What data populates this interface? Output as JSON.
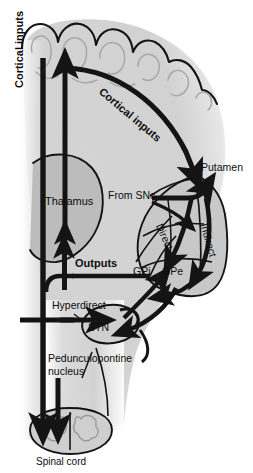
{
  "figure": {
    "kind": "neuroanatomy-circuit-diagram",
    "palette": {
      "brain_fill": "#d2d2d2",
      "brain_fill_light": "#dcdcdc",
      "deep_structure_fill": "#b9b9b9",
      "striatum_fill": "#c6c6c6",
      "outline": "#111111",
      "arrow": "#141414",
      "page_background": "#ffffff",
      "text": "#0d0d0d"
    }
  },
  "labels": {
    "cortical_inputs_vertical": "Cortical inputs",
    "cortical_inputs_diagonal": "Cortical inputs",
    "putamen": "Putamen",
    "from_snc": "From SNc",
    "thalamus": "Thalamus",
    "outputs": "Outputs",
    "hyperdirect": "Hyperdirect",
    "direct": "Direct",
    "indirect": "Indirect",
    "gpi": "GPi",
    "gpe": "GPe",
    "stn": "STN",
    "pedunculopontine_line1": "Pedunculopontine",
    "pedunculopontine_line2": "nucleus",
    "spinal_cord": "Spinal cord"
  },
  "anatomy": {
    "regions": [
      {
        "name": "cerebral-cortex",
        "label_shown": false
      },
      {
        "name": "thalamus",
        "label_shown": true,
        "label": "Thalamus"
      },
      {
        "name": "putamen",
        "label_shown": true,
        "label": "Putamen"
      },
      {
        "name": "globus-pallidus-internal",
        "label_shown": true,
        "label": "GPi"
      },
      {
        "name": "globus-pallidus-external",
        "label_shown": true,
        "label": "GPe"
      },
      {
        "name": "subthalamic-nucleus",
        "label_shown": true,
        "label": "STN"
      },
      {
        "name": "substantia-nigra-pars-compacta",
        "label_shown": true,
        "label": "From SNc"
      },
      {
        "name": "pedunculopontine-nucleus",
        "label_shown": true,
        "label": "Pedunculopontine nucleus"
      },
      {
        "name": "spinal-cord",
        "label_shown": true,
        "label": "Spinal cord"
      }
    ],
    "pathways": [
      {
        "name": "cortical-inputs-descending",
        "label": "Cortical inputs",
        "orientation": "vertical"
      },
      {
        "name": "cortical-inputs-to-putamen",
        "label": "Cortical inputs",
        "orientation": "diagonal"
      },
      {
        "name": "direct-pathway",
        "label": "Direct"
      },
      {
        "name": "indirect-pathway",
        "label": "Indirect"
      },
      {
        "name": "hyperdirect-pathway",
        "label": "Hyperdirect"
      },
      {
        "name": "basal-ganglia-outputs",
        "label": "Outputs"
      },
      {
        "name": "thalamocortical-ascending",
        "label": ""
      },
      {
        "name": "nigrostriatal-from-snc",
        "label": "From SNc"
      },
      {
        "name": "descending-to-spinal-cord",
        "label": ""
      }
    ]
  }
}
